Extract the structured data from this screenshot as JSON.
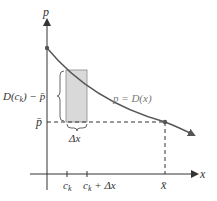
{
  "diagram": {
    "axes": {
      "y_label": "p",
      "x_label": "x"
    },
    "curve": {
      "label": "p = D(x)",
      "color": "#555555"
    },
    "rectangle": {
      "fill": "#d9d9d9",
      "stroke": "#888888",
      "height_label": "D(c",
      "height_label_sub": "k",
      "height_label_tail": ") − p̄",
      "width_label": "Δx"
    },
    "levels": {
      "p_bar_label": "p̄"
    },
    "ticks": {
      "c_k": "c",
      "c_k_sub": "k",
      "c_k_plus_dx": "c",
      "c_k_plus_dx_sub": "k",
      "c_k_plus_dx_tail": " + Δx",
      "x_bar": "x̄"
    }
  }
}
